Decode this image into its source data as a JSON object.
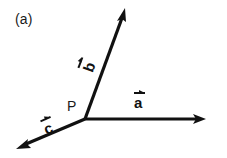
{
  "figure": {
    "panel_label": "(a)",
    "background_color": "#ffffff",
    "stroke_color": "#111111",
    "width": 227,
    "height": 158
  },
  "points": [
    {
      "name": "P",
      "label": "P",
      "x": 85,
      "y": 119
    }
  ],
  "vectors": [
    {
      "name": "a",
      "label": "a",
      "accent": "arrow",
      "origin": {
        "x": 85,
        "y": 119
      },
      "tip": {
        "x": 205,
        "y": 119
      },
      "direction_deg": 0
    },
    {
      "name": "b",
      "label": "b",
      "accent": "arrow",
      "origin": {
        "x": 85,
        "y": 119
      },
      "tip": {
        "x": 125,
        "y": 9
      },
      "direction_deg": 70
    },
    {
      "name": "c",
      "label": "c",
      "accent": "arrow",
      "origin": {
        "x": 85,
        "y": 119
      },
      "tip": {
        "x": 17,
        "y": 148
      },
      "direction_deg": 203
    }
  ]
}
